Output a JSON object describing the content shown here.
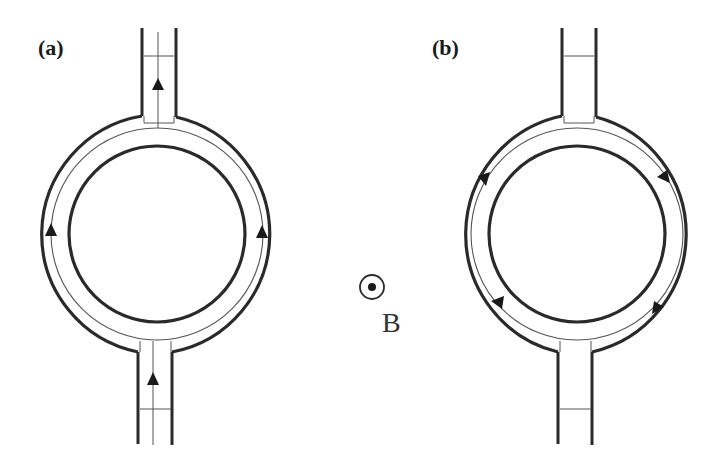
{
  "figure": {
    "panels": [
      {
        "label": "(a)",
        "description": "Ring with two leads; current flows upward through both arms",
        "top_lead_arrow": "up",
        "bottom_lead_arrow": "up",
        "ring_arrows": [
          "left-arm-up",
          "right-arm-up"
        ],
        "has_lead_centerline": true
      },
      {
        "label": "(b)",
        "description": "Ring with two leads; circulating current clockwise, no lead current",
        "top_lead_arrow": "none",
        "bottom_lead_arrow": "none",
        "ring_arrows": [
          "clockwise",
          "clockwise",
          "clockwise",
          "clockwise"
        ],
        "has_lead_centerline": false
      }
    ],
    "field": {
      "symbol": "out-of-page-dot-icon",
      "label": "B"
    },
    "colors": {
      "stroke": "#2a2a2a",
      "thin_stroke": "#555555",
      "background": "#ffffff"
    }
  }
}
